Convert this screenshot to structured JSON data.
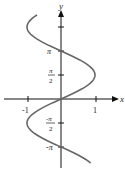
{
  "chart_data": {
    "type": "line",
    "title": "",
    "equation": "x = sin(y)",
    "xlabel": "x",
    "ylabel": "y",
    "x_ticks": [
      "-1",
      "1"
    ],
    "y_ticks": [
      "π",
      "π/2",
      "-π/2",
      "-π"
    ],
    "y_range": [
      -4.2,
      5.5
    ],
    "x_range": [
      -1,
      1
    ],
    "grid": false,
    "series": [
      {
        "name": "x = sin(y)",
        "y_from": -4.2,
        "y_to": 5.5
      }
    ]
  },
  "labels": {
    "x_axis": "x",
    "y_axis": "y",
    "x_neg1": "-1",
    "x_pos1": "1",
    "pi": "π",
    "pi_num": "π",
    "pi_den": "2",
    "neg_pi_num": "-π",
    "neg_pi_den": "2",
    "neg_pi": "-π"
  },
  "colors": {
    "curve": "#666666",
    "axis": "#111111"
  }
}
